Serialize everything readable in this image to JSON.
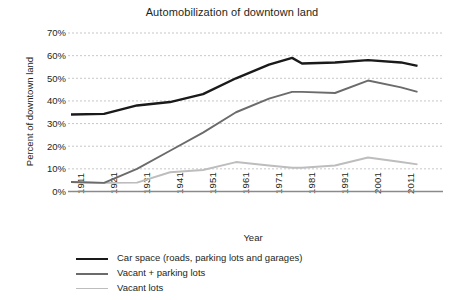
{
  "chart_data": {
    "type": "line",
    "title": "Automobilization of downtown land",
    "xlabel": "Year",
    "ylabel": "Percent of downtown land",
    "xlim": [
      1911,
      2016
    ],
    "ylim": [
      0,
      70
    ],
    "y_tick_labels": [
      "70%",
      "60%",
      "50%",
      "40%",
      "30%",
      "20%",
      "10%",
      "0%"
    ],
    "y_tick_values": [
      70,
      60,
      50,
      40,
      30,
      20,
      10,
      0
    ],
    "x_tick_labels": [
      "1911",
      "1921",
      "1931",
      "1941",
      "1951",
      "1961",
      "1971",
      "1981",
      "1991",
      "2001",
      "2011"
    ],
    "x_tick_values": [
      1911,
      1921,
      1931,
      1941,
      1951,
      1961,
      1971,
      1981,
      1991,
      2001,
      2011
    ],
    "grid": "horizontal-dotted",
    "legend_position": "below",
    "x": [
      1911,
      1921,
      1931,
      1941,
      1951,
      1961,
      1971,
      1978,
      1981,
      1991,
      2001,
      2011,
      2016
    ],
    "series": [
      {
        "name": "Car space (roads, parking lots and garages)",
        "color": "#1a1a1a",
        "width": 2.4,
        "values": [
          34,
          34.3,
          38,
          39.5,
          43,
          50,
          56,
          59,
          56.5,
          57,
          58,
          57,
          55.5
        ]
      },
      {
        "name": "Vacant + parking lots",
        "color": "#6b6b6b",
        "width": 1.9,
        "values": [
          4.2,
          3.8,
          10,
          18,
          26,
          35,
          41,
          44,
          44,
          43.5,
          49,
          46,
          44
        ]
      },
      {
        "name": "Vacant lots",
        "color": "#bdbdbd",
        "width": 1.9,
        "values": [
          4.2,
          3.8,
          3.9,
          8.5,
          9.5,
          13,
          11.5,
          10.5,
          10.5,
          11.5,
          15,
          13,
          12
        ]
      }
    ]
  },
  "legend": {
    "items": [
      {
        "label": "Car space (roads, parking lots and garages)"
      },
      {
        "label": "Vacant + parking lots"
      },
      {
        "label": "Vacant lots"
      }
    ]
  }
}
